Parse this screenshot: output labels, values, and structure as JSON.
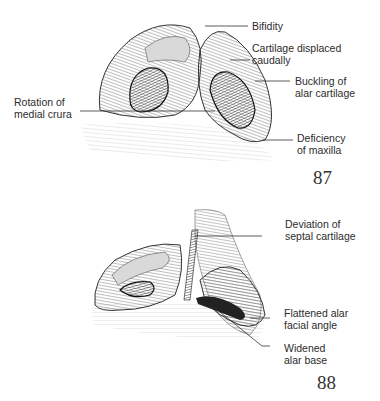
{
  "figures": [
    {
      "number": "87",
      "labels": {
        "bifidity": [
          "Bifidity"
        ],
        "cartilage_displaced": [
          "Cartilage displaced",
          "caudally"
        ],
        "buckling": [
          "Buckling of",
          "alar cartilage"
        ],
        "rotation": [
          "Rotation of",
          "medial crura"
        ],
        "deficiency": [
          "Deficiency",
          "of maxilla"
        ]
      }
    },
    {
      "number": "88",
      "labels": {
        "deviation": [
          "Deviation of",
          "septal cartilage"
        ],
        "flattened": [
          "Flattened alar",
          "facial angle"
        ],
        "widened": [
          "Widened",
          "alar base"
        ]
      }
    }
  ],
  "colors": {
    "ink": "#2a2a2a",
    "background": "#ffffff",
    "shade": "#d9d9d9"
  }
}
